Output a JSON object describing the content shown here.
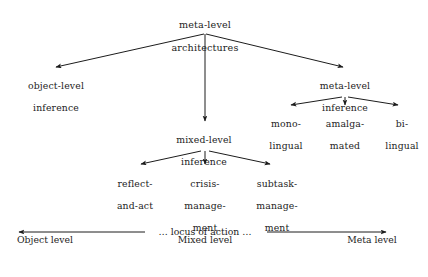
{
  "figure": {
    "background_color": "#ffffff",
    "ink_color": "#1c1c1c"
  },
  "tree": {
    "root": {
      "id": "meta-level-architectures",
      "line1": "meta-level",
      "line2": "architectures",
      "x": 205,
      "y": 8
    },
    "nodes": [
      {
        "id": "object-level-inference",
        "line1": "object-level",
        "line2": "inference",
        "x": 56,
        "y": 70
      },
      {
        "id": "meta-level-inference",
        "line1": "meta-level",
        "line2": "inference",
        "x": 345,
        "y": 70
      },
      {
        "id": "mixed-level-inference",
        "line1": "mixed-level",
        "line2": "inference",
        "x": 204,
        "y": 124
      },
      {
        "id": "mono-lingual",
        "line1": "mono-",
        "line2": "lingual",
        "x": 286,
        "y": 108
      },
      {
        "id": "amalgamated",
        "line1": "amalga-",
        "line2": "mated",
        "x": 345,
        "y": 108
      },
      {
        "id": "bi-lingual",
        "line1": "bi-",
        "line2": "lingual",
        "x": 402,
        "y": 108
      },
      {
        "id": "reflect-and-act",
        "line1": "reflect-",
        "line2": "and-act",
        "x": 135,
        "y": 168
      },
      {
        "id": "crisis-management",
        "line1": "crisis-",
        "line2": "manage-",
        "line3": "ment",
        "x": 205,
        "y": 168
      },
      {
        "id": "subtask-management",
        "line1": "subtask-",
        "line2": "manage-",
        "line3": "ment",
        "x": 277,
        "y": 168
      }
    ],
    "edges": [
      {
        "from": "meta-level-architectures",
        "to": "object-level-inference",
        "x1": 204,
        "y1": 34,
        "x2": 56,
        "y2": 67
      },
      {
        "from": "meta-level-architectures",
        "to": "meta-level-inference",
        "x1": 206,
        "y1": 34,
        "x2": 343,
        "y2": 67
      },
      {
        "from": "meta-level-architectures",
        "to": "mixed-level-inference",
        "x1": 205,
        "y1": 34,
        "x2": 205,
        "y2": 121
      },
      {
        "from": "meta-level-inference",
        "to": "mono-lingual",
        "x1": 342,
        "y1": 97,
        "x2": 291,
        "y2": 105
      },
      {
        "from": "meta-level-inference",
        "to": "amalgamated",
        "x1": 345,
        "y1": 97,
        "x2": 345,
        "y2": 105
      },
      {
        "from": "meta-level-inference",
        "to": "bi-lingual",
        "x1": 348,
        "y1": 97,
        "x2": 398,
        "y2": 105
      },
      {
        "from": "mixed-level-inference",
        "to": "reflect-and-act",
        "x1": 201,
        "y1": 151,
        "x2": 141,
        "y2": 164
      },
      {
        "from": "mixed-level-inference",
        "to": "crisis-management",
        "x1": 205,
        "y1": 151,
        "x2": 205,
        "y2": 164
      },
      {
        "from": "mixed-level-inference",
        "to": "subtask-management",
        "x1": 209,
        "y1": 151,
        "x2": 270,
        "y2": 164
      }
    ]
  },
  "axis": {
    "caption": "… locus of action …",
    "caption_x": 205,
    "caption_y": 226,
    "left_arrow": {
      "x1": 145,
      "y1": 232,
      "x2": 19,
      "y2": 232
    },
    "right_arrow": {
      "x1": 267,
      "y1": 232,
      "x2": 386,
      "y2": 232
    },
    "labels": [
      {
        "id": "object-level",
        "line1": "Object",
        "line2": "level",
        "x": 45,
        "y": 234
      },
      {
        "id": "mixed-level",
        "line1": "Mixed",
        "line2": "level",
        "x": 205,
        "y": 234
      },
      {
        "id": "meta-level",
        "line1": "Meta",
        "line2": "level",
        "x": 372,
        "y": 234
      }
    ]
  }
}
